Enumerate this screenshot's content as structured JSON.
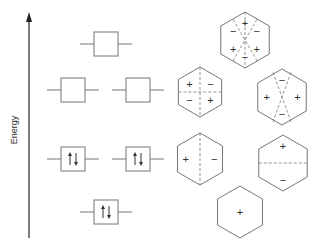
{
  "axis": {
    "label": "Energy",
    "direction": "up"
  },
  "levels": [
    {
      "name": "level-4-highest",
      "degeneracy": 1,
      "orbitals": [
        {
          "electrons": 0
        }
      ]
    },
    {
      "name": "level-3",
      "degeneracy": 2,
      "orbitals": [
        {
          "electrons": 0
        },
        {
          "electrons": 0
        }
      ]
    },
    {
      "name": "level-2",
      "degeneracy": 2,
      "orbitals": [
        {
          "electrons": 2
        },
        {
          "electrons": 2
        }
      ]
    },
    {
      "name": "level-1-lowest",
      "degeneracy": 1,
      "orbitals": [
        {
          "electrons": 2
        }
      ]
    }
  ],
  "hexagons": [
    {
      "name": "hexagon-psi6",
      "nodes": [
        "vertical",
        "diag-60",
        "diag-120"
      ],
      "signs": [
        {
          "label": "+",
          "pos": "top"
        },
        {
          "label": "−",
          "pos": "upper-left"
        },
        {
          "label": "−",
          "pos": "upper-right"
        },
        {
          "label": "+",
          "pos": "lower-left"
        },
        {
          "label": "+",
          "pos": "lower-right"
        },
        {
          "label": "−",
          "pos": "bottom"
        }
      ]
    },
    {
      "name": "hexagon-psi4",
      "nodes": [
        "vertical",
        "horizontal"
      ],
      "signs": [
        {
          "label": "+",
          "pos": "upper-left"
        },
        {
          "label": "−",
          "pos": "upper-right"
        },
        {
          "label": "−",
          "pos": "lower-left"
        },
        {
          "label": "+",
          "pos": "lower-right"
        }
      ]
    },
    {
      "name": "hexagon-psi5",
      "nodes": [
        "diag-a",
        "diag-b"
      ],
      "signs": [
        {
          "label": "−",
          "pos": "top"
        },
        {
          "label": "+",
          "pos": "left"
        },
        {
          "label": "+",
          "pos": "right"
        },
        {
          "label": "−",
          "pos": "bottom"
        }
      ]
    },
    {
      "name": "hexagon-psi2",
      "nodes": [
        "vertical"
      ],
      "signs": [
        {
          "label": "+",
          "pos": "left"
        },
        {
          "label": "−",
          "pos": "right"
        }
      ]
    },
    {
      "name": "hexagon-psi3",
      "nodes": [
        "horizontal"
      ],
      "signs": [
        {
          "label": "+",
          "pos": "top"
        },
        {
          "label": "−",
          "pos": "bottom"
        }
      ]
    },
    {
      "name": "hexagon-psi1",
      "nodes": [],
      "signs": [
        {
          "label": "+",
          "pos": "center"
        }
      ]
    }
  ]
}
